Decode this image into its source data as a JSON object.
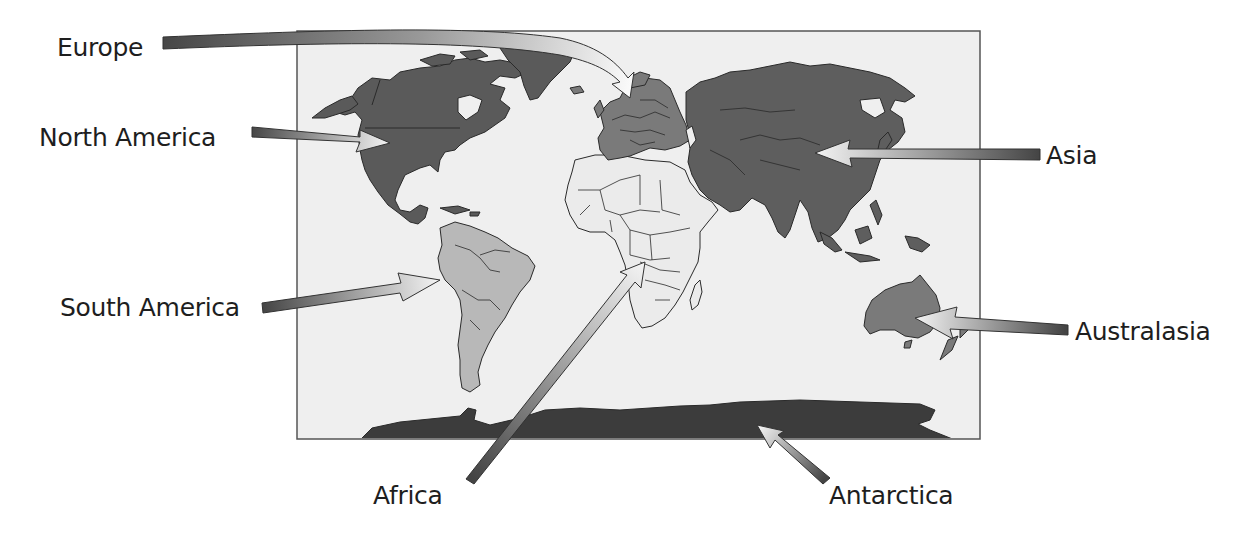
{
  "diagram": {
    "map": {
      "frame": {
        "x": 297,
        "y": 31,
        "width": 683,
        "height": 408
      },
      "background_color": "#efefef",
      "border_color": "#555555"
    },
    "continents": [
      {
        "name": "Europe",
        "label": "Europe",
        "fill": "#7a7a7a",
        "label_pos": {
          "x": 57,
          "y": 33
        }
      },
      {
        "name": "North America",
        "label": "North America",
        "fill": "#5a5a5a",
        "label_pos": {
          "x": 39,
          "y": 126
        }
      },
      {
        "name": "Asia",
        "label": "Asia",
        "fill": "#5e5e5e",
        "label_pos": {
          "x": 1044,
          "y": 145
        }
      },
      {
        "name": "South America",
        "label": "South America",
        "fill": "#b8b8b8",
        "label_pos": {
          "x": 60,
          "y": 295
        }
      },
      {
        "name": "Australasia",
        "label": "Australasia",
        "fill": "#7a7a7a",
        "label_pos": {
          "x": 1075,
          "y": 319
        }
      },
      {
        "name": "Africa",
        "label": "Africa",
        "fill": "#e8e8e8",
        "label_pos": {
          "x": 373,
          "y": 483
        }
      },
      {
        "name": "Antarctica",
        "label": "Antarctica",
        "fill": "#3c3c3c",
        "label_pos": {
          "x": 830,
          "y": 483
        }
      }
    ],
    "arrow_style": {
      "tail_color": "#4a4a4a",
      "head_color": "#f4f4f4",
      "outline": "#333333"
    }
  }
}
